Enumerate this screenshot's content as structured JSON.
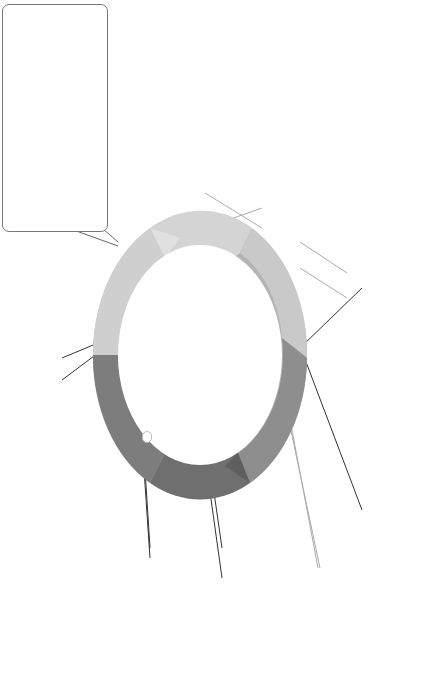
{
  "diagram": {
    "title_lines": [
      "Clinical",
      "reasoning",
      "cycle"
    ],
    "orientation": "rotated 90° counter-clockwise",
    "colors": {
      "ring_light": "#c8c8c8",
      "ring_mid": "#9a9a9a",
      "ring_dark": "#6e6e6e",
      "text": "#222222",
      "box_border": "#777777"
    },
    "stages": [
      {
        "label": "Consider the patient situation",
        "lines": [
          "Consider",
          "the patient",
          "situation"
        ],
        "box": [
          {
            "u": "Describe",
            "t": " or list facts, context objects or people."
          }
        ]
      },
      {
        "label": "Collect cues/information",
        "lines": [
          "Collect cues/",
          "information"
        ],
        "box": [
          {
            "t": "Review current information (e.g. handover reports, patient history, patient charts, results of investigations and nursing/medical assessments previously undertaken)."
          },
          {
            "t": "Gather new information (e.g. undertake patient assessment)."
          },
          {
            "t": "Recall knowledge (e.g. physiology, pathophysiology, pharmacology, epidemiology, therapeutics, context of care, ethics, law etc)."
          }
        ]
      },
      {
        "label": "Process information",
        "lines": [
          "Process",
          "information"
        ],
        "box": [
          {
            "u": "Interpret",
            "t": ": analyse data to come to an understanding of signs or symptoms. Compare normal Vs abnormal."
          },
          {
            "u": "Discriminate",
            "t": ": distinguish relevant from irrelevant information; recognise inconsistencies, narrow down the information to what is most important and recognise gaps in cues collected."
          },
          {
            "u": "Relate",
            "t": ": discover new relationships or patterns; cluster cues together to identify relationships between them."
          },
          {
            "u": "Infer",
            "t": ": make deductions or form opinions that follow logically by interpreting subjective and objective cues; consider alternatives and consequences."
          },
          {
            "u": "Match",
            "t": " current situation to past situations or current patient to past patients (usually an expert thought process)."
          },
          {
            "u": "Predict",
            "t": " an outcome (usually an expert thought process)."
          }
        ]
      },
      {
        "label": "Identify problems/issues",
        "lines": [
          "Identify",
          "problems/",
          "issues"
        ],
        "box": [
          {
            "u": "Synthesise",
            "t": " facts and inferences to make a definitive diagnosis of the patient's problem."
          }
        ]
      },
      {
        "label": "Establish goal/s",
        "lines": [
          "Establish",
          "goal/s"
        ],
        "box": [
          {
            "u": "Describe",
            "t": " what you want to happen, a desired outcome, a time frame."
          }
        ]
      },
      {
        "label": "Take action",
        "lines": [
          "Take action"
        ],
        "box": [
          {
            "u": "Select",
            "t": " a course of action between different alternatives available."
          }
        ]
      },
      {
        "label": "Evaluate outcomes",
        "lines": [
          "Evaluate",
          "outcomes"
        ],
        "box": [
          {
            "u": "Evaluate",
            "t": " the effectiveness of actions and outcomes. Ask: ",
            "i": "'has the situation improved now?"
          }
        ]
      },
      {
        "label": "Reflect on process and new learning",
        "lines": [
          "Reflect on",
          "process and",
          "new learning"
        ],
        "box": [
          {
            "u": "Contemplate",
            "t": " what you have learnt from this process and what you would do differently next time."
          }
        ]
      }
    ]
  }
}
